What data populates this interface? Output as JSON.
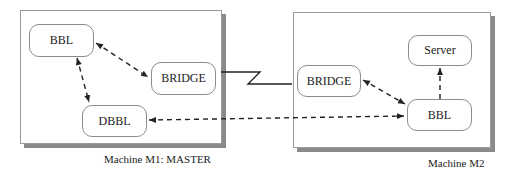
{
  "machines": [
    {
      "id": "m1",
      "label": "Machine M1: MASTER",
      "nodes": [
        "BBL",
        "BRIDGE",
        "DBBL"
      ]
    },
    {
      "id": "m2",
      "label": "Machine M2",
      "nodes": [
        "Server",
        "BRIDGE",
        "BBL"
      ]
    }
  ],
  "m1": {
    "label": "Machine M1: MASTER",
    "bbl": "BBL",
    "bridge": "BRIDGE",
    "dbbl": "DBBL"
  },
  "m2": {
    "label": "Machine M2",
    "server": "Server",
    "bridge": "BRIDGE",
    "bbl": "BBL"
  },
  "connections": [
    {
      "from": "M1.BBL",
      "to": "M1.BRIDGE",
      "style": "dashed",
      "arrows": "both"
    },
    {
      "from": "M1.BBL",
      "to": "M1.DBBL",
      "style": "dashed",
      "arrows": "both"
    },
    {
      "from": "M1.BRIDGE",
      "to": "M2.BRIDGE",
      "style": "solid-zigzag",
      "arrows": "none"
    },
    {
      "from": "M1.DBBL",
      "to": "M2.BBL",
      "style": "dashed",
      "arrows": "both"
    },
    {
      "from": "M2.BRIDGE",
      "to": "M2.BBL",
      "style": "dashed",
      "arrows": "both"
    },
    {
      "from": "M2.BBL",
      "to": "M2.Server",
      "style": "dashed",
      "arrows": "to"
    }
  ]
}
